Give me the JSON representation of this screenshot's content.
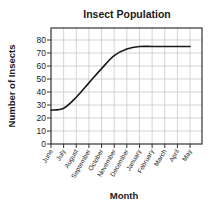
{
  "chart_data": {
    "type": "line",
    "title": "Insect Population",
    "xlabel": "Month",
    "ylabel": "Number of Insects",
    "categories": [
      "June",
      "July",
      "August",
      "September",
      "October",
      "November",
      "December",
      "January",
      "February",
      "March",
      "April",
      "May"
    ],
    "series": [
      {
        "name": "Insect Population",
        "values": [
          26,
          27.5,
          36,
          47,
          58,
          68,
          73,
          75,
          75,
          75,
          75,
          75
        ]
      }
    ],
    "yticks": [
      0,
      10,
      20,
      30,
      40,
      50,
      60,
      70,
      80
    ],
    "ylim": [
      0,
      89
    ],
    "grid": true,
    "legend": "none",
    "colors": {
      "line": "#1a1a1a",
      "grid": "#c8c8c8",
      "frame": "#333333"
    }
  }
}
